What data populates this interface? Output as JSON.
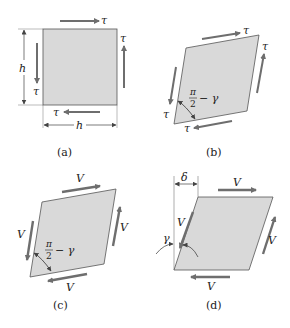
{
  "figure": {
    "colors": {
      "fill": "#d9d9d9",
      "edge": "#555555",
      "arrow": "#6e6e6e",
      "dim": "#555555"
    },
    "panels": [
      {
        "id": "a",
        "caption": "(a)",
        "force_label": "τ",
        "dimension_label": "h",
        "shape": "square"
      },
      {
        "id": "b",
        "caption": "(b)",
        "force_label": "τ",
        "angle_label": {
          "numerator": "π",
          "denominator": "2",
          "suffix": "− γ"
        },
        "shape": "rhombus"
      },
      {
        "id": "c",
        "caption": "(c)",
        "force_label": "V",
        "angle_label": {
          "numerator": "π",
          "denominator": "2",
          "suffix": "− γ"
        },
        "shape": "rhombus"
      },
      {
        "id": "d",
        "caption": "(d)",
        "force_label": "V",
        "displacement_label": "δ",
        "angle_label": "γ",
        "shape": "parallelogram"
      }
    ]
  }
}
